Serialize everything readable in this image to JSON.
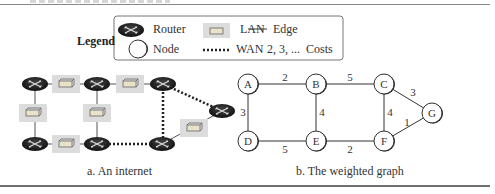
{
  "legend": {
    "title": "Legend",
    "items": [
      {
        "icon": "router-icon",
        "label": "Router"
      },
      {
        "icon": "lan-icon",
        "label": "LAN"
      },
      {
        "icon": "edge-line-icon",
        "label": "Edge"
      },
      {
        "icon": "node-circle-icon",
        "label": "Node"
      },
      {
        "icon": "wan-dotted-line-icon",
        "label": "WAN"
      },
      {
        "icon": "costs-text",
        "label": "2, 3, ...  Costs"
      }
    ]
  },
  "left_panel": {
    "caption": "a. An internet",
    "routers": 7,
    "lans": 6,
    "wans": 3
  },
  "right_panel": {
    "caption": "b. The weighted graph",
    "nodes": [
      "A",
      "B",
      "C",
      "D",
      "E",
      "F",
      "G"
    ],
    "edges": [
      {
        "from": "A",
        "to": "B",
        "cost": "2"
      },
      {
        "from": "B",
        "to": "C",
        "cost": "5"
      },
      {
        "from": "A",
        "to": "D",
        "cost": "3"
      },
      {
        "from": "B",
        "to": "E",
        "cost": "4"
      },
      {
        "from": "C",
        "to": "F",
        "cost": "4"
      },
      {
        "from": "C",
        "to": "G",
        "cost": "3"
      },
      {
        "from": "F",
        "to": "G",
        "cost": "1"
      },
      {
        "from": "D",
        "to": "E",
        "cost": "5"
      },
      {
        "from": "E",
        "to": "F",
        "cost": "2"
      }
    ]
  }
}
